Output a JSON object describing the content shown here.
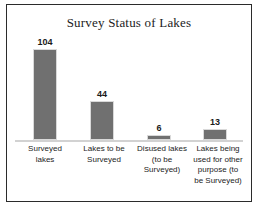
{
  "chart_data": {
    "type": "bar",
    "title": "Survey Status of Lakes",
    "xlabel": "",
    "ylabel": "",
    "ylim": [
      0,
      120
    ],
    "grid": false,
    "legend": "none",
    "categories": [
      "Surveyed lakes",
      "Lakes to be Surveyed",
      "Disused lakes (to be Surveyed)",
      "Lakes being used for other purpose (to be Surveyed)"
    ],
    "category_lines": [
      [
        "Surveyed",
        "lakes"
      ],
      [
        "Lakes to be",
        "Surveyed"
      ],
      [
        "Disused lakes",
        "(to be",
        "Surveyed)"
      ],
      [
        "Lakes being",
        "used for other",
        "purpose (to",
        "be Surveyed)"
      ]
    ],
    "values": [
      104,
      44,
      6,
      13
    ],
    "value_labels": [
      "104",
      "44",
      "6",
      "13"
    ],
    "bar_color": "#707070",
    "axis_color": "#d2d2d2",
    "border_color": "#2b2b2b",
    "background_color": "#ffffff"
  },
  "bars": [
    {
      "label": "104",
      "left": 26,
      "width": 24,
      "height_pct": 86.7,
      "label_bottom_pct": 86.7
    },
    {
      "label": "44",
      "left": 83,
      "width": 24,
      "height_pct": 36.7,
      "label_bottom_pct": 36.7
    },
    {
      "label": "6",
      "left": 140,
      "width": 24,
      "height_pct": 5.0,
      "label_bottom_pct": 5.0
    },
    {
      "label": "13",
      "left": 196,
      "width": 24,
      "height_pct": 10.8,
      "label_bottom_pct": 10.8
    }
  ],
  "category_blocks": [
    {
      "left": 8,
      "width": 60,
      "lines": [
        "Surveyed",
        "lakes"
      ]
    },
    {
      "left": 66,
      "width": 62,
      "lines": [
        "Lakes to be",
        "Surveyed"
      ]
    },
    {
      "left": 124,
      "width": 62,
      "lines": [
        "Disused lakes",
        "(to be",
        "Surveyed)"
      ]
    },
    {
      "left": 180,
      "width": 62,
      "lines": [
        "Lakes being",
        "used for other",
        "purpose (to",
        "be Surveyed)"
      ]
    }
  ]
}
